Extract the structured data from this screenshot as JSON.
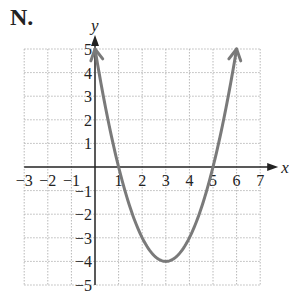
{
  "panel_label": "N.",
  "chart_data": {
    "type": "line",
    "title": "",
    "xlabel": "x",
    "ylabel": "y",
    "xlim": [
      -3,
      7
    ],
    "ylim": [
      -5,
      5
    ],
    "grid": true,
    "x_ticks": [
      "-3",
      "-2",
      "-1",
      "1",
      "2",
      "3",
      "4",
      "5",
      "6",
      "7"
    ],
    "y_ticks": [
      "5",
      "4",
      "3",
      "2",
      "1",
      "-1",
      "-2",
      "-3",
      "-4",
      "-5"
    ],
    "series": [
      {
        "name": "y = (x-1)(x-5)",
        "equation": "y = x^2 - 6x + 5",
        "color": "#7a7a7a",
        "x": [
          0,
          1,
          2,
          3,
          4,
          5,
          6
        ],
        "y": [
          5,
          0,
          -3,
          -4,
          -3,
          0,
          5
        ],
        "arrows_at_ends": true
      }
    ],
    "key_points": {
      "vertex": [
        3,
        -4
      ],
      "x_intercepts": [
        1,
        5
      ],
      "y_intercept": 5
    }
  }
}
